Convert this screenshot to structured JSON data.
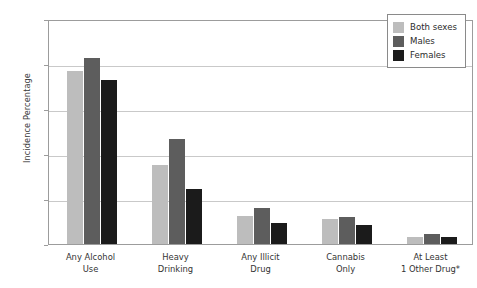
{
  "chart_data": {
    "type": "bar",
    "title": "",
    "xlabel": "",
    "ylabel": "Incidence Percentage",
    "ylim": [
      0,
      100
    ],
    "yticks": [
      0,
      20,
      40,
      60,
      80,
      100
    ],
    "grid": true,
    "legend_position": "top-right",
    "categories": [
      "Any Alcohol Use",
      "Heavy Drinking",
      "Any Illicit Drug",
      "Cannabis Only",
      "At Least 1 Other Drug*"
    ],
    "category_lines": [
      [
        "Any Alcohol",
        "Use"
      ],
      [
        "Heavy",
        "Drinking"
      ],
      [
        "Any Illicit",
        "Drug"
      ],
      [
        "Cannabis",
        "Only"
      ],
      [
        "At Least",
        "1 Other Drug*"
      ]
    ],
    "series": [
      {
        "name": "Both sexes",
        "color": "#bdbdbd",
        "values": [
          77,
          35,
          12.5,
          11,
          3
        ]
      },
      {
        "name": "Males",
        "color": "#5d5d5d",
        "values": [
          82.5,
          46.5,
          16,
          12,
          4.5
        ]
      },
      {
        "name": "Females",
        "color": "#1b1b1b",
        "values": [
          73,
          24.5,
          9.5,
          8.5,
          3
        ]
      }
    ]
  },
  "legend": {
    "items": [
      {
        "label": "Both sexes"
      },
      {
        "label": "Males"
      },
      {
        "label": "Females"
      }
    ]
  },
  "axes": {
    "y_title": "Incidence Percentage",
    "y_tick_labels": [
      "0",
      "20",
      "40",
      "60",
      "80",
      "100"
    ]
  }
}
